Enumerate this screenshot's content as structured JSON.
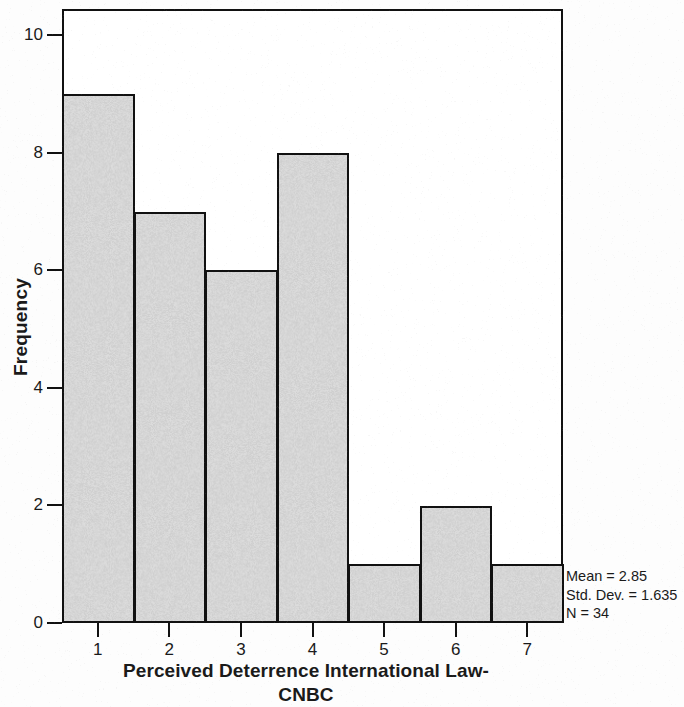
{
  "chart_data": {
    "type": "bar",
    "chart_subtype": "histogram",
    "title": "",
    "xlabel_line1": "Perceived Deterrence International Law-",
    "xlabel_line2": "CNBC",
    "ylabel": "Frequency",
    "categories": [
      "1",
      "2",
      "3",
      "4",
      "5",
      "6",
      "7"
    ],
    "values": [
      9,
      7,
      6,
      8,
      1,
      2,
      1
    ],
    "x_tick_labels": [
      "1",
      "2",
      "3",
      "4",
      "5",
      "6",
      "7"
    ],
    "y_tick_labels": [
      "0",
      "2",
      "4",
      "6",
      "8",
      "10"
    ],
    "y_tick_values": [
      0,
      2,
      4,
      6,
      8,
      10
    ],
    "ylim": [
      0,
      10.45
    ],
    "xlim": [
      0.5,
      7.5
    ],
    "grid": false,
    "legend": false,
    "bar_fill_color": "#d4d4d4",
    "bar_edge_color": "#111111",
    "background_color": "#ffffff"
  },
  "annotation": {
    "mean_label": "Mean = 2.85",
    "std_dev_label": "Std. Dev. = 1.635",
    "n_label": "N = 34",
    "mean_value": 2.85,
    "std_dev_value": 1.635,
    "n_value": 34
  }
}
